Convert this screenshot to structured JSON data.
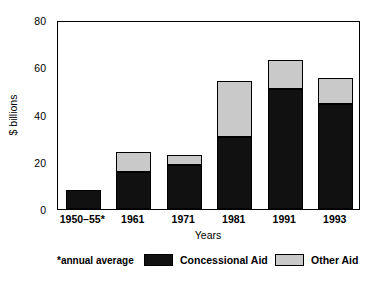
{
  "chart_data": {
    "type": "bar",
    "subtype": "stacked-bar",
    "title": "",
    "xlabel": "Years",
    "ylabel": "$ billions",
    "categories": [
      "1950–55*",
      "1961",
      "1971",
      "1981",
      "1991",
      "1993"
    ],
    "series": [
      {
        "name": "Concessional Aid",
        "color": "#111111",
        "values": [
          8,
          15.5,
          18.5,
          30.5,
          51,
          44.5
        ]
      },
      {
        "name": "Other Aid",
        "color": "#c9c9c9",
        "values": [
          0,
          8.5,
          4.5,
          23.5,
          12,
          11
        ]
      }
    ],
    "totals": [
      8,
      24,
      23,
      54,
      63,
      55.5
    ],
    "ylim": [
      0,
      80
    ],
    "yticks": [
      0,
      20,
      40,
      60,
      80
    ],
    "ytick_labels": [
      "0",
      "20",
      "40",
      "60",
      "80"
    ],
    "grid": false,
    "legend_position": "below-plot",
    "footnote": "*annual average"
  },
  "axis": {
    "y_title": "$ billions",
    "x_title": "Years"
  },
  "legend": {
    "note": "*annual average",
    "items": [
      {
        "label": "Concessional Aid",
        "color": "#111111"
      },
      {
        "label": "Other Aid",
        "color": "#c9c9c9"
      }
    ]
  }
}
